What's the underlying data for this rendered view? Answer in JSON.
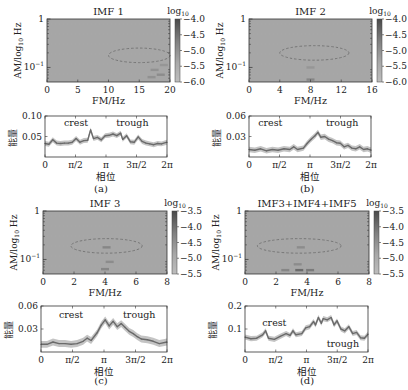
{
  "figure": {
    "panel_labels": [
      "(a)",
      "(b)",
      "(c)",
      "(d)"
    ]
  },
  "chart_data": [
    {
      "id": "a-heatmap",
      "type": "heatmap",
      "title": "IMF 1",
      "xlabel": "FM/Hz",
      "ylabel": "AM/log10 Hz",
      "xlim": [
        0,
        20
      ],
      "xticks": [
        "0",
        "5",
        "10",
        "15",
        "20"
      ],
      "xtick_values": [
        0,
        5,
        10,
        15,
        20
      ],
      "ylim_log10": [
        -1.3,
        0
      ],
      "yticks": [
        "1",
        "10^-1"
      ],
      "ytick_values_log10": [
        0,
        -1
      ],
      "colorbar": {
        "label": "log10",
        "range": [
          -6.0,
          -4.0
        ],
        "ticks": [
          "-4.0",
          "-4.5",
          "-5.0",
          "-5.5",
          "-6.0"
        ],
        "tick_values": [
          -4.0,
          -4.5,
          -5.0,
          -5.5,
          -6.0
        ]
      },
      "background_level": -5.6,
      "ellipse": {
        "center_fm": 15,
        "center_am_log10": -0.75,
        "half_width_fm": 5,
        "half_height_log10": 0.15
      },
      "hotspots": [
        {
          "fm": 17.5,
          "am_log10": -1.05,
          "level": -5.2
        },
        {
          "fm": 18.5,
          "am_log10": -1.15,
          "level": -5.1
        },
        {
          "fm": 17,
          "am_log10": -1.2,
          "level": -5.2
        },
        {
          "fm": 19,
          "am_log10": -0.95,
          "level": -5.3
        }
      ]
    },
    {
      "id": "a-line",
      "type": "line",
      "xlabel": "相位",
      "ylabel": "能量",
      "xlim": [
        0,
        6.2832
      ],
      "ylim": [
        0,
        0.1
      ],
      "xticks": [
        "0",
        "π/2",
        "π",
        "3π/2",
        "2π"
      ],
      "xtick_values": [
        0,
        1.5708,
        3.1416,
        4.7124,
        6.2832
      ],
      "yticks": [
        "0.05",
        "0.10"
      ],
      "ytick_values": [
        0.05,
        0.1
      ],
      "annotations": [
        {
          "text": "crest",
          "x": 1.6,
          "y": 0.075
        },
        {
          "text": "trough",
          "x": 4.5,
          "y": 0.075
        }
      ],
      "band_halfwidth": 0.006,
      "series": [
        {
          "name": "energy",
          "x": [
            0,
            0.2,
            0.4,
            0.6,
            0.8,
            1.0,
            1.2,
            1.4,
            1.6,
            1.8,
            2.0,
            2.2,
            2.35,
            2.5,
            2.7,
            2.9,
            3.1,
            3.3,
            3.5,
            3.7,
            3.9,
            4.0,
            4.2,
            4.4,
            4.6,
            4.8,
            5.0,
            5.2,
            5.4,
            5.6,
            5.8,
            6.0,
            6.2832
          ],
          "y": [
            0.033,
            0.031,
            0.042,
            0.034,
            0.033,
            0.034,
            0.034,
            0.036,
            0.045,
            0.036,
            0.04,
            0.041,
            0.066,
            0.045,
            0.048,
            0.042,
            0.052,
            0.053,
            0.056,
            0.052,
            0.058,
            0.043,
            0.052,
            0.037,
            0.036,
            0.049,
            0.038,
            0.034,
            0.032,
            0.03,
            0.033,
            0.032,
            0.036
          ]
        }
      ]
    },
    {
      "id": "b-heatmap",
      "type": "heatmap",
      "title": "IMF 2",
      "xlabel": "FM/Hz",
      "ylabel": "AM/log10 Hz",
      "xlim": [
        0,
        16
      ],
      "xticks": [
        "0",
        "4",
        "8",
        "12",
        "16"
      ],
      "xtick_values": [
        0,
        4,
        8,
        12,
        16
      ],
      "ylim_log10": [
        -1.3,
        0
      ],
      "yticks": [
        "1",
        "10^-1"
      ],
      "ytick_values_log10": [
        0,
        -1
      ],
      "colorbar": {
        "label": "log10",
        "range": [
          -6.0,
          -4.0
        ],
        "ticks": [
          "-4.0",
          "-4.5",
          "-5.0",
          "-5.5",
          "-6.0"
        ],
        "tick_values": [
          -4.0,
          -4.5,
          -5.0,
          -5.5,
          -6.0
        ]
      },
      "background_level": -5.6,
      "ellipse": {
        "center_fm": 8.5,
        "center_am_log10": -0.7,
        "half_width_fm": 4.5,
        "half_height_log10": 0.15
      },
      "hotspots": [
        {
          "fm": 8,
          "am_log10": -1.0,
          "level": -5.3
        },
        {
          "fm": 8,
          "am_log10": -1.25,
          "level": -5.0
        }
      ]
    },
    {
      "id": "b-line",
      "type": "line",
      "xlabel": "相位",
      "ylabel": "能量",
      "xlim": [
        0,
        6.2832
      ],
      "ylim": [
        0,
        0.06
      ],
      "xticks": [
        "0",
        "π/2",
        "π",
        "3π/2",
        "2π"
      ],
      "xtick_values": [
        0,
        1.5708,
        3.1416,
        4.7124,
        6.2832
      ],
      "yticks": [
        "0.03",
        "0.06"
      ],
      "ytick_values": [
        0.03,
        0.06
      ],
      "annotations": [
        {
          "text": "crest",
          "x": 1.1,
          "y": 0.045
        },
        {
          "text": "trough",
          "x": 4.8,
          "y": 0.045
        }
      ],
      "band_halfwidth": 0.004,
      "series": [
        {
          "name": "energy",
          "x": [
            0,
            0.3,
            0.6,
            0.9,
            1.2,
            1.5,
            1.8,
            2.1,
            2.3,
            2.5,
            2.8,
            3.0,
            3.2,
            3.4,
            3.55,
            3.7,
            3.9,
            4.1,
            4.3,
            4.5,
            4.7,
            4.9,
            5.1,
            5.3,
            5.5,
            5.7,
            5.9,
            6.1,
            6.2832
          ],
          "y": [
            0.011,
            0.01,
            0.012,
            0.009,
            0.011,
            0.01,
            0.012,
            0.011,
            0.015,
            0.011,
            0.013,
            0.02,
            0.026,
            0.031,
            0.036,
            0.029,
            0.03,
            0.026,
            0.024,
            0.021,
            0.02,
            0.015,
            0.017,
            0.013,
            0.012,
            0.015,
            0.011,
            0.012,
            0.01
          ]
        }
      ]
    },
    {
      "id": "c-heatmap",
      "type": "heatmap",
      "title": "IMF 3",
      "xlabel": "FM/Hz",
      "ylabel": "AM/log10 Hz",
      "xlim": [
        0,
        8
      ],
      "xticks": [
        "0",
        "2",
        "4",
        "6",
        "8"
      ],
      "xtick_values": [
        0,
        2,
        4,
        6,
        8
      ],
      "ylim_log10": [
        -1.3,
        0
      ],
      "yticks": [
        "1",
        "10^-1"
      ],
      "ytick_values_log10": [
        0,
        -1
      ],
      "colorbar": {
        "label": "log10",
        "range": [
          -5.5,
          -3.5
        ],
        "ticks": [
          "-3.5",
          "-4.0",
          "-4.5",
          "-5.0",
          "-5.5"
        ],
        "tick_values": [
          -3.5,
          -4.0,
          -4.5,
          -5.0,
          -5.5
        ]
      },
      "background_level": -5.1,
      "ellipse": {
        "center_fm": 4.1,
        "center_am_log10": -0.72,
        "half_width_fm": 2.3,
        "half_height_log10": 0.15
      },
      "hotspots": [
        {
          "fm": 4.1,
          "am_log10": -0.75,
          "level": -4.5
        },
        {
          "fm": 4.3,
          "am_log10": -1.05,
          "level": -4.6
        },
        {
          "fm": 4.0,
          "am_log10": -1.2,
          "level": -4.5
        }
      ]
    },
    {
      "id": "c-line",
      "type": "line",
      "xlabel": "相位",
      "ylabel": "能量",
      "xlim": [
        0,
        6.2832
      ],
      "ylim": [
        0,
        0.06
      ],
      "xticks": [
        "0",
        "π/2",
        "π",
        "3π/2",
        "2π"
      ],
      "xtick_values": [
        0,
        1.5708,
        3.1416,
        4.7124,
        6.2832
      ],
      "yticks": [
        "0.03",
        "0.06"
      ],
      "ytick_values": [
        0.03,
        0.06
      ],
      "annotations": [
        {
          "text": "crest",
          "x": 1.5,
          "y": 0.045
        },
        {
          "text": "trough",
          "x": 4.9,
          "y": 0.045
        }
      ],
      "band_halfwidth": 0.0045,
      "series": [
        {
          "name": "energy",
          "x": [
            0,
            0.3,
            0.6,
            0.9,
            1.2,
            1.5,
            1.8,
            2.1,
            2.3,
            2.5,
            2.8,
            3.0,
            3.2,
            3.4,
            3.6,
            3.8,
            4.0,
            4.2,
            4.4,
            4.6,
            4.8,
            5.0,
            5.3,
            5.6,
            5.9,
            6.2832
          ],
          "y": [
            0.01,
            0.01,
            0.013,
            0.011,
            0.011,
            0.01,
            0.011,
            0.014,
            0.018,
            0.015,
            0.025,
            0.035,
            0.042,
            0.034,
            0.04,
            0.033,
            0.037,
            0.032,
            0.027,
            0.024,
            0.02,
            0.017,
            0.016,
            0.014,
            0.011,
            0.013
          ]
        }
      ]
    },
    {
      "id": "d-heatmap",
      "type": "heatmap",
      "title": "IMF3+IMF4+IMF5",
      "xlabel": "FM/Hz",
      "ylabel": "AM/log10 Hz",
      "xlim": [
        0,
        8
      ],
      "xticks": [
        "0",
        "2",
        "4",
        "6",
        "8"
      ],
      "xtick_values": [
        0,
        2,
        4,
        6,
        8
      ],
      "ylim_log10": [
        -1.3,
        0
      ],
      "yticks": [
        "1",
        "10^-1"
      ],
      "ytick_values_log10": [
        0,
        -1
      ],
      "colorbar": {
        "label": "log10",
        "range": [
          -5.5,
          -3.5
        ],
        "ticks": [
          "-3.5",
          "-4.0",
          "-4.5",
          "-5.0",
          "-5.5"
        ],
        "tick_values": [
          -3.5,
          -4.0,
          -4.5,
          -5.0,
          -5.5
        ]
      },
      "background_level": -5.1,
      "ellipse": {
        "center_fm": 3.5,
        "center_am_log10": -0.72,
        "half_width_fm": 2.7,
        "half_height_log10": 0.15
      },
      "hotspots": [
        {
          "fm": 3.6,
          "am_log10": -0.75,
          "level": -4.6
        },
        {
          "fm": 3.4,
          "am_log10": -1.1,
          "level": -4.6
        },
        {
          "fm": 3.5,
          "am_log10": -1.22,
          "level": -4.0
        },
        {
          "fm": 4.2,
          "am_log10": -1.22,
          "level": -4.3
        },
        {
          "fm": 2.6,
          "am_log10": -1.22,
          "level": -4.5
        }
      ]
    },
    {
      "id": "d-line",
      "type": "line",
      "xlabel": "相位",
      "ylabel": "能量",
      "xlim": [
        0,
        6.2832
      ],
      "ylim": [
        0,
        0.2
      ],
      "xticks": [
        "0",
        "π/2",
        "π",
        "3π/2",
        "2π"
      ],
      "xtick_values": [
        0,
        1.5708,
        3.1416,
        4.7124,
        6.2832
      ],
      "yticks": [
        "0.1",
        "0.2"
      ],
      "ytick_values": [
        0.1,
        0.2
      ],
      "annotations": [
        {
          "text": "crest",
          "x": 1.5,
          "y": 0.115
        },
        {
          "text": "trough",
          "x": 5.0,
          "y": 0.02
        }
      ],
      "band_halfwidth": 0.011,
      "series": [
        {
          "name": "energy",
          "x": [
            0,
            0.3,
            0.6,
            0.9,
            1.05,
            1.2,
            1.5,
            1.8,
            2.1,
            2.3,
            2.45,
            2.6,
            2.9,
            3.1,
            3.3,
            3.5,
            3.6,
            3.75,
            3.9,
            4.0,
            4.2,
            4.4,
            4.55,
            4.7,
            4.9,
            5.1,
            5.3,
            5.5,
            5.7,
            5.9,
            6.1,
            6.2832
          ],
          "y": [
            0.065,
            0.058,
            0.06,
            0.075,
            0.092,
            0.06,
            0.055,
            0.068,
            0.08,
            0.072,
            0.092,
            0.075,
            0.08,
            0.105,
            0.11,
            0.132,
            0.118,
            0.15,
            0.125,
            0.145,
            0.14,
            0.15,
            0.118,
            0.135,
            0.1,
            0.092,
            0.11,
            0.08,
            0.085,
            0.062,
            0.06,
            0.078
          ]
        }
      ]
    }
  ]
}
